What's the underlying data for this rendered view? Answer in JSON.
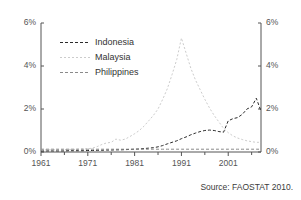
{
  "chart_data": {
    "type": "line",
    "title": "",
    "xlabel": "",
    "ylabel": "",
    "xlim": [
      1961,
      2008
    ],
    "ylim": [
      0,
      6
    ],
    "grid": false,
    "legend_position": "upper-left-inside",
    "y_tick_labels_left": [
      "6%",
      "4%",
      "2%",
      "0%"
    ],
    "y_tick_labels_right": [
      "6%",
      "4%",
      "2%",
      "0%"
    ],
    "y_tick_values": [
      6,
      4,
      2,
      0
    ],
    "x_tick_labels": [
      "1961",
      "1971",
      "1981",
      "1991",
      "2001"
    ],
    "x_tick_values": [
      1961,
      1971,
      1981,
      1991,
      2001
    ],
    "x_minor_tick_values": [
      1966,
      1976,
      1986,
      1996,
      2006
    ],
    "unit": "percent",
    "series": [
      {
        "name": "Indonesia",
        "color": "#2b2b2b",
        "dash": "3,2",
        "x": [
          1961,
          1962,
          1963,
          1964,
          1965,
          1966,
          1967,
          1968,
          1969,
          1970,
          1971,
          1972,
          1973,
          1974,
          1975,
          1976,
          1977,
          1978,
          1979,
          1980,
          1981,
          1982,
          1983,
          1984,
          1985,
          1986,
          1987,
          1988,
          1989,
          1990,
          1991,
          1992,
          1993,
          1994,
          1995,
          1996,
          1997,
          1998,
          1999,
          2000,
          2001,
          2002,
          2003,
          2004,
          2005,
          2006,
          2007,
          2008
        ],
        "values": [
          0.05,
          0.05,
          0.05,
          0.05,
          0.05,
          0.05,
          0.06,
          0.06,
          0.06,
          0.06,
          0.07,
          0.07,
          0.08,
          0.08,
          0.09,
          0.09,
          0.1,
          0.1,
          0.11,
          0.12,
          0.13,
          0.14,
          0.16,
          0.18,
          0.2,
          0.24,
          0.3,
          0.38,
          0.45,
          0.52,
          0.62,
          0.7,
          0.8,
          0.88,
          0.95,
          1.0,
          1.02,
          1.0,
          0.95,
          0.92,
          1.45,
          1.55,
          1.6,
          1.75,
          2.0,
          2.1,
          2.5,
          1.9
        ]
      },
      {
        "name": "Malaysia",
        "color": "#cccccc",
        "dash": "2,2",
        "x": [
          1961,
          1962,
          1963,
          1964,
          1965,
          1966,
          1967,
          1968,
          1969,
          1970,
          1971,
          1972,
          1973,
          1974,
          1975,
          1976,
          1977,
          1978,
          1979,
          1980,
          1981,
          1982,
          1983,
          1984,
          1985,
          1986,
          1987,
          1988,
          1989,
          1990,
          1991,
          1992,
          1993,
          1994,
          1995,
          1996,
          1997,
          1998,
          1999,
          2000,
          2001,
          2002,
          2003,
          2004,
          2005,
          2006,
          2007,
          2008
        ],
        "values": [
          0.1,
          0.1,
          0.1,
          0.1,
          0.11,
          0.11,
          0.12,
          0.12,
          0.13,
          0.14,
          0.15,
          0.18,
          0.25,
          0.35,
          0.42,
          0.45,
          0.6,
          0.55,
          0.6,
          0.72,
          0.85,
          1.0,
          1.2,
          1.45,
          1.7,
          2.0,
          2.45,
          2.95,
          3.6,
          4.3,
          5.3,
          4.6,
          3.9,
          3.35,
          2.9,
          2.45,
          2.05,
          1.7,
          1.4,
          1.1,
          0.9,
          0.75,
          0.65,
          0.58,
          0.52,
          0.48,
          0.45,
          0.45
        ]
      },
      {
        "name": "Philippines",
        "color": "#8a8a8a",
        "dash": "3,2",
        "x": [
          1961,
          1962,
          1963,
          1964,
          1965,
          1966,
          1967,
          1968,
          1969,
          1970,
          1971,
          1972,
          1973,
          1974,
          1975,
          1976,
          1977,
          1978,
          1979,
          1980,
          1981,
          1982,
          1983,
          1984,
          1985,
          1986,
          1987,
          1988,
          1989,
          1990,
          1991,
          1992,
          1993,
          1994,
          1995,
          1996,
          1997,
          1998,
          1999,
          2000,
          2001,
          2002,
          2003,
          2004,
          2005,
          2006,
          2007,
          2008
        ],
        "values": [
          0.13,
          0.13,
          0.13,
          0.13,
          0.13,
          0.13,
          0.13,
          0.13,
          0.13,
          0.13,
          0.13,
          0.13,
          0.13,
          0.13,
          0.13,
          0.13,
          0.13,
          0.13,
          0.13,
          0.13,
          0.13,
          0.13,
          0.13,
          0.13,
          0.13,
          0.13,
          0.13,
          0.13,
          0.13,
          0.13,
          0.13,
          0.13,
          0.13,
          0.13,
          0.13,
          0.13,
          0.13,
          0.13,
          0.13,
          0.13,
          0.13,
          0.13,
          0.13,
          0.13,
          0.13,
          0.13,
          0.13,
          0.13
        ]
      }
    ]
  },
  "legend": {
    "items": [
      {
        "label": "Indonesia"
      },
      {
        "label": "Malaysia"
      },
      {
        "label": "Philippines"
      }
    ]
  },
  "source_note": "Source: FAOSTAT 2010.",
  "colors": {
    "indonesia": "#2b2b2b",
    "malaysia": "#cccccc",
    "philippines": "#8a8a8a",
    "axis": "#555555",
    "text": "#3b3b3b",
    "background": "#ffffff"
  }
}
